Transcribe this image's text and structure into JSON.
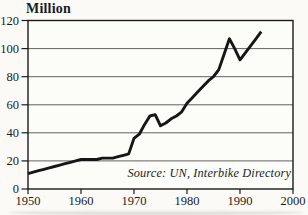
{
  "chart_data": {
    "type": "line",
    "title": "",
    "xlabel": "",
    "ylabel": "Million",
    "source": "Source: UN, Interbike Directory",
    "x": [
      1950,
      1951,
      1952,
      1953,
      1954,
      1955,
      1956,
      1957,
      1958,
      1959,
      1960,
      1961,
      1962,
      1963,
      1964,
      1965,
      1966,
      1967,
      1968,
      1969,
      1970,
      1971,
      1972,
      1973,
      1974,
      1975,
      1976,
      1977,
      1978,
      1979,
      1980,
      1981,
      1982,
      1983,
      1984,
      1985,
      1986,
      1987,
      1988,
      1989,
      1990,
      1991,
      1992,
      1993,
      1994
    ],
    "values": [
      11,
      12,
      13,
      14,
      15,
      16,
      17,
      18,
      19,
      20,
      21,
      21,
      21,
      21,
      22,
      22,
      22,
      23,
      24,
      25,
      36,
      39,
      46,
      52,
      53,
      45,
      47,
      50,
      52,
      55,
      61,
      65,
      69,
      73,
      77,
      80,
      85,
      96,
      107,
      100,
      92,
      97,
      102,
      107,
      112
    ],
    "xlim": [
      1950,
      2000
    ],
    "ylim": [
      0,
      120
    ],
    "x_ticks": [
      1950,
      1960,
      1970,
      1980,
      1990,
      2000
    ],
    "y_ticks": [
      0,
      20,
      40,
      60,
      80,
      100,
      120
    ],
    "grid": "horizontal",
    "legend": "none",
    "colors": {
      "line": "#161616",
      "grid": "#4f4f4f",
      "frame": "#1b1b1b",
      "text": "#1c1c1c",
      "plot_background": "#fcfcf9"
    }
  }
}
